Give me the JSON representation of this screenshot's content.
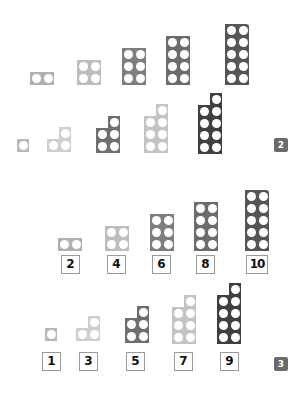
{
  "colors": {
    "1": "#b9b9b9",
    "2": "#b0b0b0",
    "3": "#cfcfcf",
    "4": "#bdbdbd",
    "5": "#6f6f6f",
    "6": "#7e7e7e",
    "7": "#c4c4c4",
    "8": "#6c6c6c",
    "9": "#3f3f3f",
    "10": "#555555"
  },
  "panel2": {
    "badge": "2",
    "even_row": [
      {
        "value": 2,
        "x": 30,
        "bottom": 85
      },
      {
        "value": 4,
        "x": 77,
        "bottom": 85
      },
      {
        "value": 6,
        "x": 122,
        "bottom": 85
      },
      {
        "value": 8,
        "x": 166,
        "bottom": 85
      },
      {
        "value": 10,
        "x": 225,
        "bottom": 85
      }
    ],
    "odd_row": [
      {
        "value": 1,
        "x": 17,
        "bottom": 152
      },
      {
        "value": 3,
        "x": 47,
        "bottom": 152
      },
      {
        "value": 5,
        "x": 96,
        "bottom": 153
      },
      {
        "value": 7,
        "x": 144,
        "bottom": 153
      },
      {
        "value": 9,
        "x": 198,
        "bottom": 154
      }
    ]
  },
  "panel3": {
    "badge": "3",
    "even_row": [
      {
        "value": 2,
        "x": 58,
        "bottom": 251,
        "label": "2",
        "label_x": 61
      },
      {
        "value": 4,
        "x": 105,
        "bottom": 251,
        "label": "4",
        "label_x": 107
      },
      {
        "value": 6,
        "x": 150,
        "bottom": 251,
        "label": "6",
        "label_x": 152
      },
      {
        "value": 8,
        "x": 194,
        "bottom": 251,
        "label": "8",
        "label_x": 196
      },
      {
        "value": 10,
        "x": 245,
        "bottom": 251,
        "label": "10",
        "label_x": 246
      }
    ],
    "odd_row": [
      {
        "value": 1,
        "x": 45,
        "bottom": 341,
        "label": "1",
        "label_x": 42
      },
      {
        "value": 3,
        "x": 76,
        "bottom": 341,
        "label": "3",
        "label_x": 79
      },
      {
        "value": 5,
        "x": 125,
        "bottom": 343,
        "label": "5",
        "label_x": 126
      },
      {
        "value": 7,
        "x": 172,
        "bottom": 344,
        "label": "7",
        "label_x": 174
      },
      {
        "value": 9,
        "x": 217,
        "bottom": 344,
        "label": "9",
        "label_x": 220
      }
    ]
  }
}
